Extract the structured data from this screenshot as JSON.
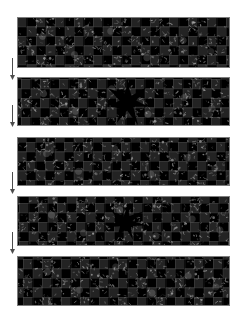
{
  "figure": {
    "title": "Sequence of five textured checkerboard lattice panels linked by downward arrows",
    "background_color": "#ffffff",
    "width": 242,
    "height": 323,
    "panel_count": 5,
    "arrow_count": 4
  },
  "colors": {
    "page_background": "#ffffff",
    "panel_background": "#0a0a0a",
    "panel_border": "#7d7d7d",
    "checker_dark": "#000000",
    "checker_light": "#232323",
    "grid_line": "#787878",
    "texture_highlight": "#969696",
    "defect_fill": "#000000",
    "arrow_color": "#4d4d4d"
  },
  "layout": {
    "panel_left": 17,
    "panel_width": 213,
    "arrow_x": 9,
    "cell_size": 9.5,
    "checker_block": 19
  },
  "panels": [
    {
      "id": "panel-1",
      "label": "Panel 1",
      "index": 1,
      "x": 17,
      "y": 17,
      "width": 213,
      "height": 51,
      "has_defect": false,
      "defect_label": "",
      "texture_seed": 11,
      "checker_offset_x": 0,
      "checker_offset_y": 0
    },
    {
      "id": "panel-2",
      "label": "Panel 2",
      "index": 2,
      "x": 17,
      "y": 77,
      "width": 213,
      "height": 49,
      "has_defect": true,
      "defect_label": "central star defect",
      "defect_cx": 52,
      "defect_cy": 50,
      "defect_r": 20,
      "texture_seed": 23,
      "checker_offset_x": 4,
      "checker_offset_y": 2
    },
    {
      "id": "panel-3",
      "label": "Panel 3",
      "index": 3,
      "x": 17,
      "y": 137,
      "width": 213,
      "height": 49,
      "has_defect": false,
      "defect_label": "",
      "texture_seed": 37,
      "checker_offset_x": 9,
      "checker_offset_y": 5
    },
    {
      "id": "panel-4",
      "label": "Panel 4",
      "index": 4,
      "x": 17,
      "y": 196,
      "width": 213,
      "height": 50,
      "has_defect": true,
      "defect_label": "central star defect",
      "defect_cx": 51,
      "defect_cy": 52,
      "defect_r": 17,
      "texture_seed": 53,
      "checker_offset_x": 2,
      "checker_offset_y": 7
    },
    {
      "id": "panel-5",
      "label": "Panel 5",
      "index": 5,
      "x": 17,
      "y": 256,
      "width": 213,
      "height": 50,
      "has_defect": false,
      "defect_label": "",
      "texture_seed": 71,
      "checker_offset_x": 6,
      "checker_offset_y": 3
    }
  ],
  "arrows": [
    {
      "id": "arrow-1",
      "label": "Arrow from panel 1 to panel 2",
      "x": 9,
      "y": 58,
      "length": 22,
      "direction": "down"
    },
    {
      "id": "arrow-2",
      "label": "Arrow from panel 2 to panel 3",
      "x": 9,
      "y": 105,
      "length": 22,
      "direction": "down"
    },
    {
      "id": "arrow-3",
      "label": "Arrow from panel 3 to panel 4",
      "x": 9,
      "y": 172,
      "length": 22,
      "direction": "down"
    },
    {
      "id": "arrow-4",
      "label": "Arrow from panel 4 to panel 5",
      "x": 9,
      "y": 232,
      "length": 22,
      "direction": "down"
    }
  ]
}
